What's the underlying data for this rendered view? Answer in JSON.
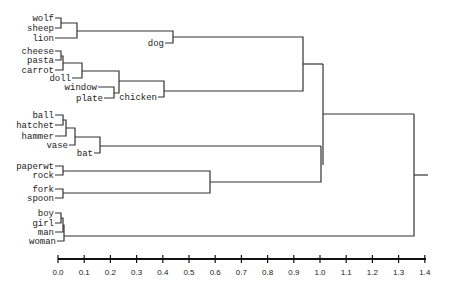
{
  "chart_data": {
    "type": "dendrogram",
    "title": "",
    "xlabel": "",
    "ylabel": "",
    "xlim": [
      0.0,
      1.4
    ],
    "x_ticks": [
      "0.0",
      "0.1",
      "0.2",
      "0.3",
      "0.4",
      "0.5",
      "0.6",
      "0.7",
      "0.8",
      "0.9",
      "1.0",
      "1.1",
      "1.2",
      "1.3",
      "1.4"
    ],
    "leaves": [
      {
        "label": "wolf",
        "y": 18
      },
      {
        "label": "sheep",
        "y": 28
      },
      {
        "label": "lion",
        "y": 38
      },
      {
        "label": "dog",
        "y": 43
      },
      {
        "label": "cheese",
        "y": 51
      },
      {
        "label": "pasta",
        "y": 60
      },
      {
        "label": "carrot",
        "y": 70
      },
      {
        "label": "doll",
        "y": 78
      },
      {
        "label": "window",
        "y": 87
      },
      {
        "label": "plate",
        "y": 98
      },
      {
        "label": "chicken",
        "y": 97
      },
      {
        "label": "ball",
        "y": 115
      },
      {
        "label": "hatchet",
        "y": 125
      },
      {
        "label": "hammer",
        "y": 136
      },
      {
        "label": "vase",
        "y": 145
      },
      {
        "label": "bat",
        "y": 153
      },
      {
        "label": "paperwt",
        "y": 166
      },
      {
        "label": "rock",
        "y": 175
      },
      {
        "label": "fork",
        "y": 189
      },
      {
        "label": "spoon",
        "y": 198
      },
      {
        "label": "boy",
        "y": 213
      },
      {
        "label": "girl",
        "y": 223
      },
      {
        "label": "man",
        "y": 232
      },
      {
        "label": "woman",
        "y": 241
      }
    ],
    "merges": [
      {
        "children": [
          "wolf",
          "sheep"
        ],
        "height": 0.01
      },
      {
        "children": [
          "wolf+sheep",
          "lion"
        ],
        "height": 0.07
      },
      {
        "children": [
          "wolf+sheep+lion",
          "dog"
        ],
        "height": 0.44
      },
      {
        "children": [
          "cheese",
          "pasta"
        ],
        "height": 0.01
      },
      {
        "children": [
          "cheese+pasta",
          "carrot"
        ],
        "height": 0.02
      },
      {
        "children": [
          "cheese+pasta+carrot",
          "doll"
        ],
        "height": 0.09
      },
      {
        "children": [
          "window",
          "plate"
        ],
        "height": 0.21
      },
      {
        "children": [
          "food+doll",
          "window+plate"
        ],
        "height": 0.23
      },
      {
        "children": [
          "food+doll+window+plate",
          "chicken"
        ],
        "height": 0.41
      },
      {
        "children": [
          "animals",
          "food+objects+chicken"
        ],
        "height": 0.935
      },
      {
        "children": [
          "ball",
          "hatchet"
        ],
        "height": 0.02
      },
      {
        "children": [
          "ball+hatchet",
          "hammer"
        ],
        "height": 0.03
      },
      {
        "children": [
          "ball+hatchet+hammer",
          "vase"
        ],
        "height": 0.065
      },
      {
        "children": [
          "tools+vase",
          "bat"
        ],
        "height": 0.16
      },
      {
        "children": [
          "paperwt",
          "rock"
        ],
        "height": 0.02
      },
      {
        "children": [
          "fork",
          "spoon"
        ],
        "height": 0.02
      },
      {
        "children": [
          "paperwt+rock",
          "fork+spoon"
        ],
        "height": 0.58
      },
      {
        "children": [
          "tools+bat",
          "paperwt+rock+fork+spoon"
        ],
        "height": 1.0
      },
      {
        "children": [
          "upper",
          "middle"
        ],
        "height": 1.01
      },
      {
        "children": [
          "boy",
          "girl",
          "man",
          "woman"
        ],
        "height": 0.02
      },
      {
        "children": [
          "all_objects",
          "people"
        ],
        "height": 1.36
      }
    ]
  }
}
